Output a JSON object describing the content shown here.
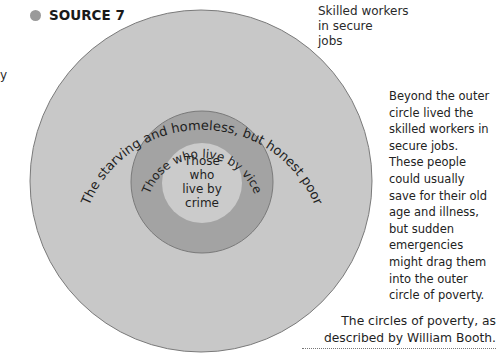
{
  "source": {
    "label": "SOURCE 7",
    "bullet_color": "#9a9a9a"
  },
  "left_fragment": "y",
  "diagram": {
    "title": "The circles of poverty",
    "outer_label": "Skilled workers in secure jobs",
    "outer_label_lines": [
      "Skilled workers",
      "in secure",
      "jobs"
    ],
    "circles": [
      {
        "name": "outer-circle",
        "label": "The starving and homeless, but honest poor",
        "fill": "#c8c8c8",
        "stroke": "#7a7a7a"
      },
      {
        "name": "middle-circle",
        "label": "Those who live by vice",
        "fill": "#a3a3a3",
        "stroke": "#7a7a7a"
      },
      {
        "name": "inner-circle",
        "label": "Those who live by crime",
        "label_lines": [
          "Those",
          "who",
          "live by",
          "crime"
        ],
        "fill": "#cbcbcb",
        "stroke": "none"
      }
    ]
  },
  "description_lines": [
    "Beyond the outer",
    "circle lived the",
    "skilled workers in",
    "secure jobs.",
    "These people",
    "could usually",
    "save for their old",
    "age and illness,",
    "but sudden",
    "emergencies",
    "might drag them",
    "into the outer",
    "circle of poverty."
  ],
  "caption": {
    "line1": "The circles of poverty, as",
    "line2": "described by William Booth."
  }
}
